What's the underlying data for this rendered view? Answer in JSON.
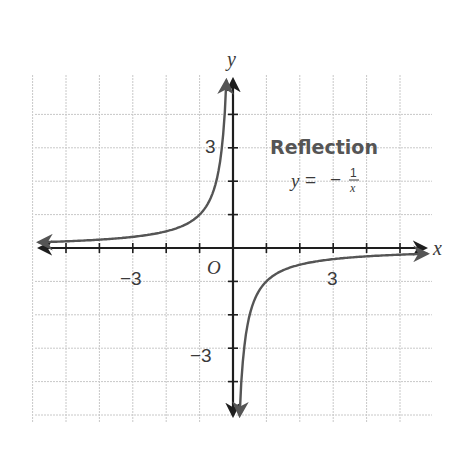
{
  "chart_data": {
    "type": "line",
    "title": "Reflection",
    "equation": "y = −1/x",
    "equation_parts": {
      "lhs": "y",
      "eq": "=",
      "sign": "−",
      "num": "1",
      "den": "x"
    },
    "xlabel": "x",
    "ylabel": "y",
    "origin_label": "O",
    "xlim": [
      -6,
      6
    ],
    "ylim": [
      -5,
      5
    ],
    "grid": true,
    "grid_step": 1,
    "x_tick_labels": [
      {
        "value": -3,
        "label": "−3"
      },
      {
        "value": 3,
        "label": "3"
      }
    ],
    "y_tick_labels": [
      {
        "value": 3,
        "label": "3"
      },
      {
        "value": -3,
        "label": "−3"
      }
    ],
    "series": [
      {
        "name": "y = −1/x",
        "function": "-1/x",
        "color": "#555555",
        "branches": [
          {
            "x": [
              -5.8,
              -5,
              -4,
              -3,
              -2,
              -1,
              -0.5,
              -0.3,
              -0.2
            ],
            "y": [
              0.17,
              0.2,
              0.25,
              0.33,
              0.5,
              1,
              2,
              3.33,
              5
            ]
          },
          {
            "x": [
              0.2,
              0.3,
              0.5,
              1,
              2,
              3,
              4,
              5,
              5.8
            ],
            "y": [
              -5,
              -3.33,
              -2,
              -1,
              -0.5,
              -0.33,
              -0.25,
              -0.2,
              -0.17
            ]
          }
        ]
      }
    ],
    "colors": {
      "axis": "#1e1e1e",
      "grid": "#c8c8c8",
      "curve": "#555555",
      "text": "#3a3a3a"
    }
  }
}
